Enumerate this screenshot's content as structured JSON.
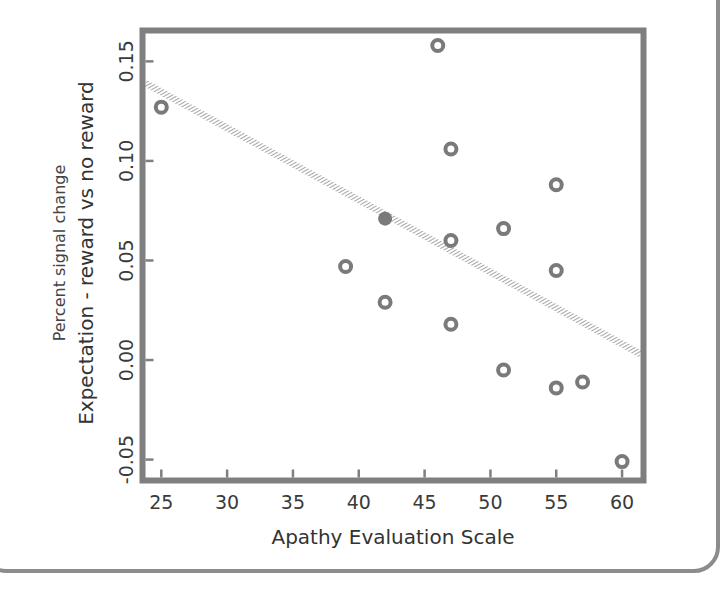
{
  "chart_data": {
    "type": "scatter",
    "title": "",
    "xlabel": "Apathy Evaluation Scale",
    "ylabel": "Expectation - reward vs no reward",
    "ylabel_secondary": "Percent signal change",
    "xlim": [
      23.8,
      61.4
    ],
    "ylim": [
      -0.059,
      0.164
    ],
    "x_ticks": [
      25,
      30,
      35,
      40,
      45,
      50,
      55,
      60
    ],
    "x_tick_labels": [
      "25",
      "30",
      "35",
      "40",
      "45",
      "50",
      "55",
      "60"
    ],
    "y_ticks": [
      -0.05,
      0.0,
      0.05,
      0.1,
      0.15
    ],
    "y_tick_labels": [
      "-0.05",
      "0.00",
      "0.05",
      "0.10",
      "0.15"
    ],
    "grid": false,
    "legend": null,
    "series": [
      {
        "name": "participants",
        "marker": "open-circle",
        "points": [
          {
            "x": 25,
            "y": 0.127
          },
          {
            "x": 46,
            "y": 0.158
          },
          {
            "x": 47,
            "y": 0.106
          },
          {
            "x": 55,
            "y": 0.088
          },
          {
            "x": 47,
            "y": 0.06
          },
          {
            "x": 51,
            "y": 0.066
          },
          {
            "x": 39,
            "y": 0.047
          },
          {
            "x": 55,
            "y": 0.045
          },
          {
            "x": 42,
            "y": 0.029
          },
          {
            "x": 47,
            "y": 0.018
          },
          {
            "x": 51,
            "y": -0.005
          },
          {
            "x": 55,
            "y": -0.014
          },
          {
            "x": 57,
            "y": -0.011
          },
          {
            "x": 60,
            "y": -0.051
          }
        ]
      },
      {
        "name": "highlighted participant",
        "marker": "filled-circle",
        "points": [
          {
            "x": 42,
            "y": 0.071
          }
        ]
      }
    ],
    "regression_line": {
      "style": "hatched",
      "from": {
        "x": 23.8,
        "y": 0.139
      },
      "to": {
        "x": 61.4,
        "y": 0.003
      }
    },
    "colors": {
      "frame": "#7f7f7f",
      "marker": "#7a7a7a",
      "line": "#8a8a8a",
      "text": "#333333"
    }
  }
}
